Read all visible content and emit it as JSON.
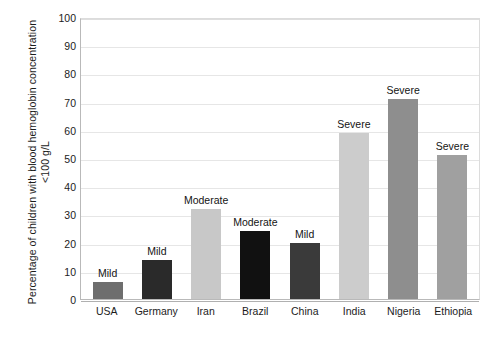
{
  "chart_data": {
    "type": "bar",
    "title": "",
    "xlabel": "",
    "ylabel": "Percentage of children with blood hemoglobin concentration <100 g/L",
    "ylim": [
      0,
      100
    ],
    "yticks": [
      100,
      90,
      80,
      70,
      60,
      50,
      40,
      30,
      20,
      10,
      0
    ],
    "ytick_labels": [
      "100",
      "90",
      "80",
      "70",
      "60",
      "50",
      "40",
      "30",
      "20",
      "10",
      "0"
    ],
    "grid": true,
    "legend": "none",
    "categories": [
      "USA",
      "Germany",
      "Iran",
      "Brazil",
      "China",
      "India",
      "Nigeria",
      "Ethiopia"
    ],
    "values": [
      6,
      14,
      32,
      24,
      20,
      59,
      71,
      51
    ],
    "point_labels": [
      "Mild",
      "Mild",
      "Moderate",
      "Moderate",
      "Mild",
      "Severe",
      "Severe",
      "Severe"
    ],
    "bar_colors": [
      "#6e6e6e",
      "#2a2a2a",
      "#c8c8c8",
      "#111111",
      "#3a3a3a",
      "#cccccc",
      "#8e8e8e",
      "#a0a0a0"
    ],
    "bars": [
      {
        "category": "USA",
        "value": 6,
        "label": "Mild",
        "color": "#6e6e6e"
      },
      {
        "category": "Germany",
        "value": 14,
        "label": "Mild",
        "color": "#2a2a2a"
      },
      {
        "category": "Iran",
        "value": 32,
        "label": "Moderate",
        "color": "#c8c8c8"
      },
      {
        "category": "Brazil",
        "value": 24,
        "label": "Moderate",
        "color": "#111111"
      },
      {
        "category": "China",
        "value": 20,
        "label": "Mild",
        "color": "#3a3a3a"
      },
      {
        "category": "India",
        "value": 59,
        "label": "Severe",
        "color": "#cccccc"
      },
      {
        "category": "Nigeria",
        "value": 71,
        "label": "Severe",
        "color": "#8e8e8e"
      },
      {
        "category": "Ethiopia",
        "value": 51,
        "label": "Severe",
        "color": "#a0a0a0"
      }
    ]
  }
}
